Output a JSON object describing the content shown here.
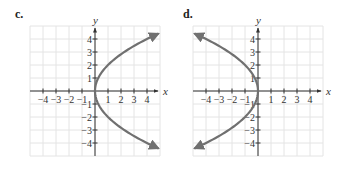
{
  "chart_data": [
    {
      "type": "line",
      "panel_label": "c.",
      "title": "",
      "xlabel": "x",
      "ylabel": "y",
      "xlim": [
        -5,
        5
      ],
      "ylim": [
        -5,
        5
      ],
      "grid": true,
      "x_ticks": [
        -4,
        -3,
        -2,
        -1,
        1,
        2,
        3,
        4
      ],
      "y_ticks": [
        -4,
        -3,
        -2,
        -1,
        1,
        2,
        3,
        4
      ],
      "x_tick_labels": [
        "−4",
        "−3",
        "−2",
        "−1",
        "1",
        "2",
        "3",
        "4"
      ],
      "y_tick_labels": [
        "−4",
        "−3",
        "−2",
        "−1",
        "1",
        "2",
        "3",
        "4"
      ],
      "series": [
        {
          "name": "x = y²/4",
          "description": "parabola opening right, vertex at origin",
          "y_range": [
            -4.4,
            4.4
          ],
          "points": [
            {
              "x": 4.84,
              "y": -4.4
            },
            {
              "x": 4,
              "y": -4
            },
            {
              "x": 2.25,
              "y": -3
            },
            {
              "x": 1,
              "y": -2
            },
            {
              "x": 0.25,
              "y": -1
            },
            {
              "x": 0,
              "y": 0
            },
            {
              "x": 0.25,
              "y": 1
            },
            {
              "x": 1,
              "y": 2
            },
            {
              "x": 2.25,
              "y": 3
            },
            {
              "x": 4,
              "y": 4
            },
            {
              "x": 4.84,
              "y": 4.4
            }
          ],
          "color": "#707070",
          "arrows": true
        }
      ]
    },
    {
      "type": "line",
      "panel_label": "d.",
      "title": "",
      "xlabel": "x",
      "ylabel": "y",
      "xlim": [
        -5,
        5
      ],
      "ylim": [
        -5,
        5
      ],
      "grid": true,
      "x_ticks": [
        -4,
        -3,
        -2,
        -1,
        1,
        2,
        3,
        4
      ],
      "y_ticks": [
        -4,
        -3,
        -2,
        -1,
        1,
        2,
        3,
        4
      ],
      "x_tick_labels": [
        "−4",
        "−3",
        "−2",
        "−1",
        "1",
        "2",
        "3",
        "4"
      ],
      "y_tick_labels": [
        "−4",
        "−3",
        "−2",
        "−1",
        "1",
        "2",
        "3",
        "4"
      ],
      "series": [
        {
          "name": "x = −y²/4",
          "description": "parabola opening left, vertex at origin",
          "y_range": [
            -4.4,
            4.4
          ],
          "points": [
            {
              "x": -4.84,
              "y": -4.4
            },
            {
              "x": -4,
              "y": -4
            },
            {
              "x": -2.25,
              "y": -3
            },
            {
              "x": -1,
              "y": -2
            },
            {
              "x": -0.25,
              "y": -1
            },
            {
              "x": 0,
              "y": 0
            },
            {
              "x": -0.25,
              "y": 1
            },
            {
              "x": -1,
              "y": 2
            },
            {
              "x": -2.25,
              "y": 3
            },
            {
              "x": -4,
              "y": 4
            },
            {
              "x": -4.84,
              "y": 4.4
            }
          ],
          "color": "#707070",
          "arrows": true
        }
      ]
    }
  ]
}
